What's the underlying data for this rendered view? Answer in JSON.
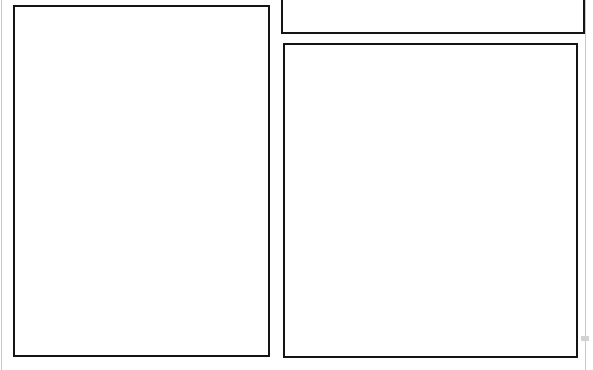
{
  "page": {
    "width": 593,
    "height": 370,
    "background_color": "#ffffff",
    "rule_color": "#141414",
    "faint_rule_color": "#c9c9c9",
    "notch_color": "#d2d2d2"
  },
  "regions": [
    {
      "id": "left-panel",
      "label": "",
      "content": "",
      "x": 13,
      "y": 5,
      "width": 257,
      "height": 352,
      "clipped": "none"
    },
    {
      "id": "upper-right-panel",
      "label": "",
      "content": "",
      "x": 281,
      "y": -20,
      "width": 304,
      "height": 54,
      "clipped": "top"
    },
    {
      "id": "lower-right-panel",
      "label": "",
      "content": "",
      "x": 283,
      "y": 43,
      "width": 295,
      "height": 315,
      "clipped": "none"
    }
  ],
  "edge_rules": [
    {
      "id": "left-edge-rule",
      "x": 1,
      "y": 0,
      "height": 370
    },
    {
      "id": "right-edge-rule",
      "x": 585,
      "y": 0,
      "height": 370
    }
  ],
  "marks": [
    {
      "id": "right-edge-notch",
      "x": 581,
      "y": 336,
      "width": 8,
      "height": 5
    }
  ]
}
